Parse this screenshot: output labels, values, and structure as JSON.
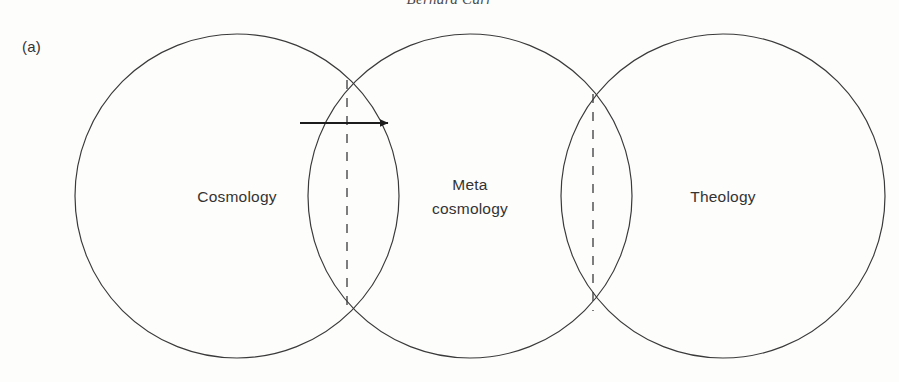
{
  "page": {
    "running_head": "Bernard Carr",
    "panel_label": "(a)",
    "background_color": "#fdfdfc",
    "stroke_color": "#3a3a3a",
    "text_color": "#333333"
  },
  "diagram": {
    "type": "venn-three-circle-chain",
    "circles": [
      {
        "id": "cosmology",
        "label": "Cosmology",
        "label_lines": [
          "Cosmology"
        ],
        "cx": 237,
        "cy": 196,
        "r": 162
      },
      {
        "id": "meta-cosmology",
        "label": "Meta cosmology",
        "label_lines": [
          "Meta",
          "cosmology"
        ],
        "cx": 470,
        "cy": 196,
        "r": 162
      },
      {
        "id": "theology",
        "label": "Theology",
        "label_lines": [
          "Theology"
        ],
        "cx": 723,
        "cy": 196,
        "r": 162
      }
    ],
    "dashed_dividers": [
      {
        "id": "cosmology-meta-divider",
        "x": 347,
        "y1": 80,
        "y2": 309
      },
      {
        "id": "meta-theology-divider",
        "x": 593,
        "y1": 94,
        "y2": 311
      }
    ],
    "arrow": {
      "id": "cosmology-to-meta-arrow",
      "direction": "right",
      "x1": 300,
      "x2": 396,
      "y": 123
    }
  }
}
